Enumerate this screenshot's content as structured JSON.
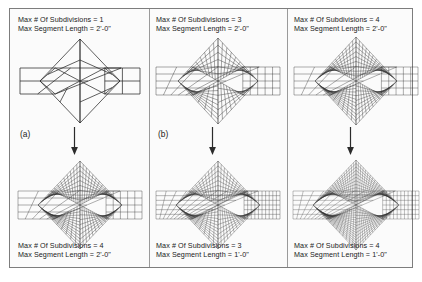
{
  "figure": {
    "border_color": "#7d7d7d",
    "background": "#fbfbfb",
    "line_color": "#2b2b2b",
    "text_color": "#1a1a1a"
  },
  "columns": [
    {
      "id": "col-a",
      "letter": "(a)",
      "top": {
        "caption_line1": "Max # Of Subdivisions = 1",
        "caption_line2": "Max Segment Length = 2'-0\"",
        "subdivisions": 1,
        "segment_length": "2'-0\"",
        "side_cols": 2,
        "side_rows": 2,
        "diamond_rings": 1
      },
      "bottom": {
        "caption_line1": "Max # Of Subdivisions = 4",
        "caption_line2": "Max Segment Length = 2'-0\"",
        "subdivisions": 4,
        "segment_length": "2'-0\"",
        "side_cols": 5,
        "side_rows": 4,
        "diamond_rings": 14
      },
      "arrow": "down-arrow"
    },
    {
      "id": "col-b",
      "letter": "(b)",
      "top": {
        "caption_line1": "Max # Of Subdivisions = 3",
        "caption_line2": "Max Segment Length = 2'-0\"",
        "subdivisions": 3,
        "segment_length": "2'-0\"",
        "side_cols": 5,
        "side_rows": 4,
        "diamond_rings": 9
      },
      "bottom": {
        "caption_line1": "Max # Of Subdivisions = 3",
        "caption_line2": "Max Segment Length = 1'-0\"",
        "subdivisions": 3,
        "segment_length": "1'-0\"",
        "side_cols": 10,
        "side_rows": 6,
        "diamond_rings": 12
      },
      "arrow": "down-arrow"
    },
    {
      "id": "col-c",
      "letter": "",
      "top": {
        "caption_line1": "Max # Of Subdivisions = 4",
        "caption_line2": "Max Segment Length = 2'-0\"",
        "subdivisions": 4,
        "segment_length": "2'-0\"",
        "side_cols": 5,
        "side_rows": 4,
        "diamond_rings": 13
      },
      "bottom": {
        "caption_line1": "Max # Of Subdivisions = 4",
        "caption_line2": "Max Segment Length = 1'-0\"",
        "subdivisions": 4,
        "segment_length": "1'-0\"",
        "side_cols": 10,
        "side_rows": 6,
        "diamond_rings": 18
      },
      "arrow": "down-arrow"
    }
  ]
}
